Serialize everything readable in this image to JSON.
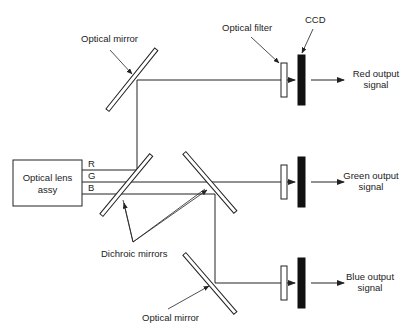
{
  "diagram": {
    "type": "optical color separation block diagram",
    "labels": {
      "optical_mirror_top": "Optical mirror",
      "optical_filter": "Optical filter",
      "ccd": "CCD",
      "lens_line1": "Optical  lens",
      "lens_line2": "assy",
      "channel_r": "R",
      "channel_g": "G",
      "channel_b": "B",
      "dichroic_mirrors": "Dichroic mirrors",
      "optical_mirror_bottom": "Optical mirror",
      "red_line1": "Red output",
      "red_line2": "signal",
      "green_line1": "Green output",
      "green_line2": "signal",
      "blue_line1": "Blue output",
      "blue_line2": "signal"
    },
    "components": [
      "Optical lens assy",
      "Optical mirror (top)",
      "Dichroic mirror 1",
      "Dichroic mirror 2",
      "Optical mirror (bottom)",
      "Optical filter x3",
      "CCD x3"
    ],
    "outputs": [
      "Red output signal",
      "Green output signal",
      "Blue output signal"
    ]
  }
}
